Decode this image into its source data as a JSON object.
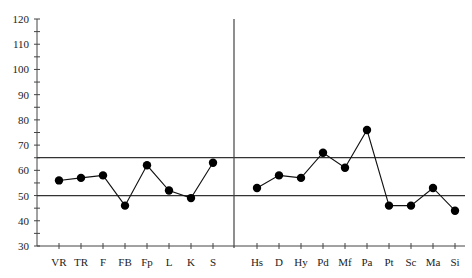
{
  "chart_data": {
    "type": "line",
    "title": "",
    "xlabel": "",
    "ylabel": "",
    "ylim": [
      30,
      120
    ],
    "yticks": [
      30,
      40,
      50,
      60,
      70,
      80,
      90,
      100,
      110,
      120
    ],
    "grid": false,
    "reference_lines": [
      50,
      65
    ],
    "groups": [
      {
        "name": "validity",
        "categories": [
          "VR",
          "TR",
          "F",
          "FB",
          "Fp",
          "L",
          "K",
          "S"
        ],
        "values": [
          56,
          57,
          58,
          46,
          62,
          52,
          49,
          63
        ]
      },
      {
        "name": "clinical",
        "categories": [
          "Hs",
          "D",
          "Hy",
          "Pd",
          "Mf",
          "Pa",
          "Pt",
          "Sc",
          "Ma",
          "Si"
        ],
        "values": [
          53,
          58,
          57,
          67,
          61,
          76,
          46,
          46,
          53,
          44
        ]
      }
    ]
  }
}
